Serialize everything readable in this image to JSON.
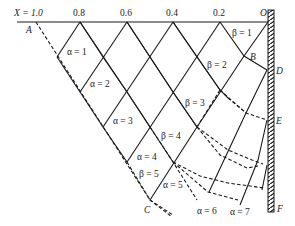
{
  "figure": {
    "type": "slip-line field / characteristic net diagram",
    "axis": {
      "x_label": "X = 1.0",
      "ticks": [
        "0.8",
        "0.6",
        "0.4",
        "0.2"
      ],
      "origin_label": "O"
    },
    "points": {
      "A": "A",
      "B": "B",
      "C": "C",
      "D": "D",
      "E": "E",
      "F": "F"
    },
    "alpha_labels": [
      "α = 1",
      "α = 2",
      "α = 3",
      "α = 4",
      "α = 5",
      "α = 6",
      "α = 7"
    ],
    "beta_labels": [
      "β = 1",
      "β = 2",
      "β = 3",
      "β = 4",
      "β = 5"
    ],
    "wall": "hatched vertical wall at right"
  }
}
